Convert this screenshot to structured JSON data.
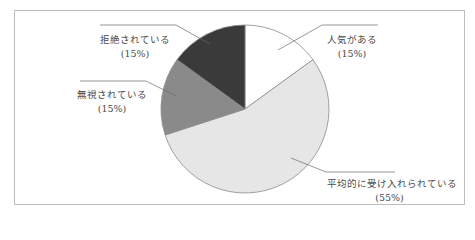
{
  "chart_data": {
    "type": "pie",
    "title": "",
    "categories": [
      "人気がある",
      "平均的に受け入れられている",
      "無視されている",
      "拒絶されている"
    ],
    "values": [
      15,
      55,
      15,
      15
    ],
    "unit": "%",
    "value_labels": [
      "(15%)",
      "(55%)",
      "(15%)",
      "(15%)"
    ],
    "colors": [
      "#ffffff",
      "#e6e6e6",
      "#8a8a8a",
      "#3a3a3a"
    ],
    "start_angle_deg": 0,
    "direction": "clockwise",
    "legend": "none",
    "labels_position": "outside-with-leader-lines"
  },
  "labels": {
    "popular": {
      "name": "人気がある",
      "pct": "(15%)"
    },
    "average": {
      "name": "平均的に受け入れられている",
      "pct": "(55%)"
    },
    "ignored": {
      "name": "無視されている",
      "pct": "(15%)"
    },
    "rejected": {
      "name": "拒絶されている",
      "pct": "(15%)"
    }
  }
}
